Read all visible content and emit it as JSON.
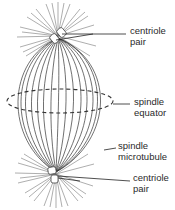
{
  "diagram": {
    "type": "labeled-illustration",
    "colors": {
      "line": "#333333",
      "rays": "#666666",
      "background": "#ffffff"
    },
    "labels": [
      {
        "id": "top-centriole",
        "lines": [
          "centriole",
          "pair"
        ]
      },
      {
        "id": "equator",
        "lines": [
          "spindle",
          "equator"
        ]
      },
      {
        "id": "microtubule",
        "lines": [
          "spindle",
          "microtubule"
        ]
      },
      {
        "id": "bottom-centriole",
        "lines": [
          "centriole",
          "pair"
        ]
      }
    ]
  }
}
